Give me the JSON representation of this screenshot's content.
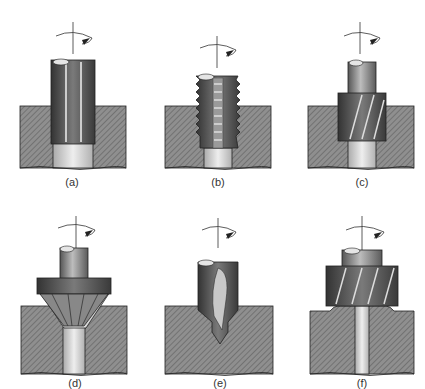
{
  "figure": {
    "panels": [
      {
        "id": "a",
        "label": "(a)",
        "tool": "straight-flute reamer in bored hole"
      },
      {
        "id": "b",
        "label": "(b)",
        "tool": "tap threading a hole"
      },
      {
        "id": "c",
        "label": "(c)",
        "tool": "helical counterbore cutter"
      },
      {
        "id": "d",
        "label": "(d)",
        "tool": "countersink"
      },
      {
        "id": "e",
        "label": "(e)",
        "tool": "center drill / spot drill"
      },
      {
        "id": "f",
        "label": "(f)",
        "tool": "spot facing cutter"
      }
    ],
    "colors": {
      "workpiece_fill": "#8a8a8a",
      "hatch": "#5a5a5a",
      "tool_dark": "#3e3e3e",
      "tool_mid": "#6d6d6d",
      "tool_light": "#bdbdbd",
      "hole": "#d9d9d9",
      "outline": "#222222"
    }
  }
}
